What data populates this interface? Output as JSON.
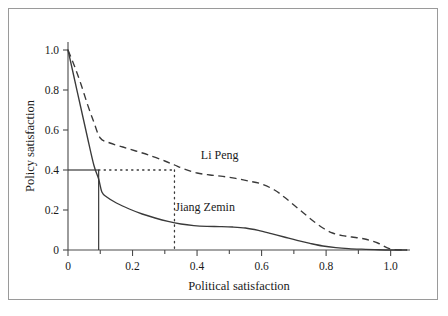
{
  "chart_data": {
    "type": "line",
    "title": "",
    "xlabel": "Political satisfaction",
    "ylabel": "Policy satisfaction",
    "xlim": [
      0,
      1.06
    ],
    "ylim": [
      0,
      1.04
    ],
    "grid": false,
    "legend_position": "inline-annotation",
    "xticks": [
      0,
      0.2,
      0.4,
      0.6,
      0.8,
      1.0
    ],
    "xtick_labels": [
      "0",
      "0.2",
      "0.4",
      "0.6",
      "0.8",
      "1.0"
    ],
    "xminor_ticks": [
      0.1,
      0.3,
      0.5,
      0.7,
      0.9
    ],
    "yticks": [
      0,
      0.2,
      0.4,
      0.6,
      0.8,
      1.0
    ],
    "ytick_labels": [
      "0",
      "0.2",
      "0.4",
      "0.6",
      "0.8",
      "1.0"
    ],
    "series": [
      {
        "name": "Li Peng",
        "style": "dashed",
        "label_x": 0.47,
        "label_y": 0.455,
        "x": [
          0.0,
          0.02,
          0.04,
          0.06,
          0.08,
          0.1,
          0.13,
          0.17,
          0.21,
          0.25,
          0.3,
          0.33,
          0.36,
          0.4,
          0.44,
          0.48,
          0.52,
          0.56,
          0.6,
          0.64,
          0.67,
          0.7,
          0.73,
          0.76,
          0.79,
          0.82,
          0.85,
          0.88,
          0.92,
          0.96,
          1.0,
          1.05
        ],
        "y": [
          1.0,
          0.92,
          0.83,
          0.73,
          0.64,
          0.56,
          0.535,
          0.515,
          0.495,
          0.475,
          0.445,
          0.425,
          0.405,
          0.385,
          0.375,
          0.368,
          0.358,
          0.345,
          0.33,
          0.3,
          0.265,
          0.225,
          0.185,
          0.145,
          0.11,
          0.085,
          0.072,
          0.065,
          0.055,
          0.035,
          0.005,
          0.0
        ]
      },
      {
        "name": "Jiang Zemin",
        "style": "solid",
        "label_x": 0.425,
        "label_y": 0.195,
        "x": [
          0.0,
          0.02,
          0.04,
          0.06,
          0.08,
          0.095,
          0.105,
          0.12,
          0.15,
          0.19,
          0.23,
          0.27,
          0.31,
          0.35,
          0.39,
          0.43,
          0.47,
          0.51,
          0.55,
          0.59,
          0.63,
          0.67,
          0.71,
          0.75,
          0.79,
          0.83,
          0.87,
          0.91,
          0.95,
          1.0,
          1.05
        ],
        "y": [
          1.0,
          0.855,
          0.71,
          0.565,
          0.425,
          0.355,
          0.29,
          0.265,
          0.235,
          0.205,
          0.18,
          0.16,
          0.143,
          0.13,
          0.122,
          0.118,
          0.117,
          0.115,
          0.11,
          0.098,
          0.082,
          0.065,
          0.048,
          0.033,
          0.02,
          0.012,
          0.007,
          0.004,
          0.002,
          0.0,
          0.0
        ]
      }
    ],
    "reference_lines": [
      {
        "name": "solid-threshold",
        "style": "solid",
        "description": "horizontal at y=0.4 from axis to x=0.095, then vertical down to y=0",
        "y_value": 0.4,
        "x_value": 0.095
      },
      {
        "name": "dotted-threshold",
        "style": "dotted",
        "description": "horizontal dotted at y=0.4 from x=0.095 to x=0.33, then vertical dotted down to y=0",
        "y_value": 0.4,
        "x_value": 0.33
      }
    ]
  }
}
